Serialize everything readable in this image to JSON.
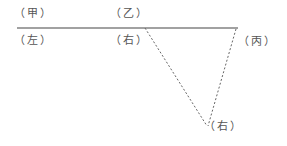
{
  "labels": {
    "jia": "（甲）",
    "yi": "（乙）",
    "zuo": "（左）",
    "you_top": "（右）",
    "bing": "（丙）",
    "you_bottom": "（右）"
  },
  "colors": {
    "line": "#444444",
    "dashed": "#666666",
    "text": "#555555"
  }
}
